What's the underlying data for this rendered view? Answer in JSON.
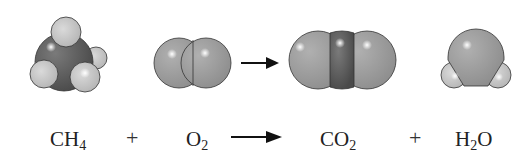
{
  "equation": {
    "reactants": [
      {
        "id": "ch4",
        "base": "CH",
        "sub": "4",
        "full": "CH4"
      },
      {
        "id": "o2",
        "base": "O",
        "sub": "2",
        "full": "O2"
      }
    ],
    "products": [
      {
        "id": "co2",
        "base": "CO",
        "sub": "2",
        "full": "CO2"
      },
      {
        "id": "h2o",
        "base": "H",
        "sub": "2",
        "tail": "O",
        "full": "H2O"
      }
    ],
    "plus_symbol": "+",
    "arrow_symbol": "→"
  },
  "colors": {
    "carbon": "#5a5a5a",
    "oxygen": "#9a9a9a",
    "hydrogen": "#c4c4c4",
    "outline": "#333333",
    "text": "#222222"
  },
  "models": [
    {
      "id": "ch4-model",
      "label": "methane"
    },
    {
      "id": "o2-model",
      "label": "oxygen"
    },
    {
      "id": "co2-model",
      "label": "carbon dioxide"
    },
    {
      "id": "h2o-model",
      "label": "water"
    }
  ]
}
